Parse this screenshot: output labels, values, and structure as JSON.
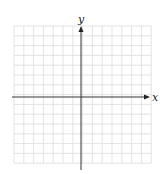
{
  "diagram": {
    "type": "coordinate-plane",
    "x_axis_label": "x",
    "y_axis_label": "y",
    "grid": {
      "columns": 14,
      "rows": 14,
      "left": 14,
      "top": 26,
      "cell": 9.8,
      "line_color": "#dcdcdc"
    },
    "axis_color": "#333333"
  }
}
